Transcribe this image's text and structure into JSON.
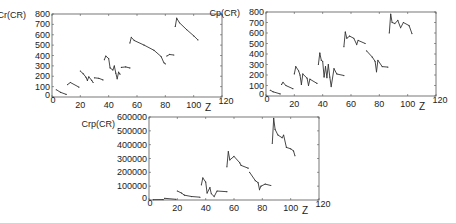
{
  "chart_data": [
    {
      "type": "line",
      "title": "",
      "ylabel": "Cr(CR)",
      "xlabel": "Z",
      "xlim": [
        0,
        120
      ],
      "ylim": [
        0,
        800
      ],
      "xticks": [
        0,
        20,
        40,
        60,
        80,
        100,
        120
      ],
      "yticks": [
        0,
        100,
        200,
        300,
        400,
        500,
        600,
        700,
        800
      ],
      "grid": false,
      "frame": {
        "left": 52,
        "right": 222,
        "top": 14,
        "bottom": 97
      },
      "segments": [
        [
          [
            3,
            70
          ],
          [
            6,
            45
          ],
          [
            10,
            25
          ]
        ],
        [
          [
            11,
            120
          ],
          [
            13,
            140
          ],
          [
            19,
            95
          ]
        ],
        [
          [
            20,
            250
          ],
          [
            22,
            225
          ],
          [
            24,
            190
          ],
          [
            25,
            160
          ],
          [
            26,
            195
          ],
          [
            28,
            160
          ],
          [
            29,
            140
          ]
        ],
        [
          [
            30,
            185
          ],
          [
            33,
            180
          ],
          [
            36,
            165
          ]
        ],
        [
          [
            37,
            360
          ],
          [
            38,
            395
          ],
          [
            40,
            370
          ],
          [
            41,
            280
          ],
          [
            43,
            260
          ],
          [
            44,
            300
          ],
          [
            45,
            230
          ],
          [
            46,
            175
          ],
          [
            47,
            240
          ],
          [
            48,
            220
          ]
        ],
        [
          [
            49,
            285
          ],
          [
            52,
            290
          ],
          [
            55,
            280
          ]
        ],
        [
          [
            55,
            520
          ],
          [
            56,
            575
          ],
          [
            58,
            545
          ],
          [
            65,
            500
          ],
          [
            72,
            450
          ],
          [
            77,
            390
          ],
          [
            79,
            330
          ],
          [
            80,
            320
          ]
        ],
        [
          [
            81,
            395
          ],
          [
            83,
            410
          ],
          [
            86,
            405
          ]
        ],
        [
          [
            87,
            680
          ],
          [
            88,
            760
          ],
          [
            90,
            715
          ],
          [
            95,
            650
          ],
          [
            100,
            590
          ],
          [
            103,
            550
          ]
        ]
      ]
    },
    {
      "type": "line",
      "title": "",
      "ylabel": "Cp(CR)",
      "xlabel": "Z",
      "xlim": [
        0,
        120
      ],
      "ylim": [
        0,
        800
      ],
      "xticks": [
        0,
        20,
        40,
        60,
        80,
        100,
        120
      ],
      "yticks": [
        0,
        100,
        200,
        300,
        400,
        500,
        600,
        700,
        800
      ],
      "grid": false,
      "frame": {
        "left": 266,
        "right": 436,
        "top": 12,
        "bottom": 96
      },
      "segments": [
        [
          [
            3,
            55
          ],
          [
            5,
            40
          ],
          [
            10,
            20
          ]
        ],
        [
          [
            11,
            110
          ],
          [
            12,
            130
          ],
          [
            14,
            100
          ],
          [
            19,
            70
          ]
        ],
        [
          [
            20,
            210
          ],
          [
            21,
            280
          ],
          [
            23,
            240
          ],
          [
            24,
            200
          ],
          [
            25,
            110
          ],
          [
            26,
            210
          ],
          [
            29,
            170
          ],
          [
            30,
            100
          ],
          [
            31,
            160
          ],
          [
            36,
            120
          ]
        ],
        [
          [
            37,
            300
          ],
          [
            38,
            410
          ],
          [
            39,
            340
          ],
          [
            40,
            330
          ],
          [
            41,
            180
          ],
          [
            42,
            280
          ],
          [
            43,
            175
          ],
          [
            44,
            300
          ],
          [
            45,
            180
          ],
          [
            46,
            90
          ],
          [
            48,
            260
          ],
          [
            50,
            210
          ],
          [
            55,
            195
          ]
        ],
        [
          [
            55,
            470
          ],
          [
            56,
            610
          ],
          [
            57,
            550
          ],
          [
            59,
            570
          ],
          [
            62,
            550
          ],
          [
            64,
            490
          ],
          [
            65,
            530
          ],
          [
            70,
            500
          ]
        ],
        [
          [
            71,
            430
          ],
          [
            75,
            370
          ],
          [
            77,
            330
          ],
          [
            78,
            230
          ],
          [
            79,
            340
          ],
          [
            82,
            280
          ],
          [
            86,
            275
          ]
        ],
        [
          [
            87,
            600
          ],
          [
            88,
            780
          ],
          [
            89,
            700
          ],
          [
            91,
            690
          ],
          [
            93,
            720
          ],
          [
            95,
            650
          ],
          [
            97,
            700
          ],
          [
            101,
            670
          ],
          [
            103,
            595
          ]
        ]
      ]
    },
    {
      "type": "line",
      "title": "",
      "ylabel": "Crp(CR)",
      "xlabel": "Z",
      "xlim": [
        0,
        120
      ],
      "ylim": [
        0,
        600000
      ],
      "xticks": [
        0,
        20,
        40,
        60,
        80,
        100,
        120
      ],
      "yticks": [
        0,
        100000,
        200000,
        300000,
        400000,
        500000,
        600000
      ],
      "grid": false,
      "frame": {
        "left": 149,
        "right": 319,
        "top": 117,
        "bottom": 200
      },
      "segments": [
        [
          [
            3,
            2000
          ],
          [
            10,
            3000
          ]
        ],
        [
          [
            11,
            12000
          ],
          [
            19,
            5000
          ]
        ],
        [
          [
            20,
            65000
          ],
          [
            23,
            50000
          ],
          [
            25,
            35000
          ],
          [
            30,
            25000
          ],
          [
            36,
            20000
          ]
        ],
        [
          [
            37,
            110000
          ],
          [
            38,
            160000
          ],
          [
            40,
            130000
          ],
          [
            41,
            50000
          ],
          [
            43,
            90000
          ],
          [
            44,
            45000
          ],
          [
            46,
            25000
          ],
          [
            48,
            65000
          ],
          [
            55,
            60000
          ]
        ],
        [
          [
            55,
            240000
          ],
          [
            56,
            350000
          ],
          [
            57,
            290000
          ],
          [
            60,
            315000
          ],
          [
            64,
            270000
          ],
          [
            65,
            250000
          ],
          [
            70,
            230000
          ]
        ],
        [
          [
            71,
            200000
          ],
          [
            75,
            140000
          ],
          [
            77,
            125000
          ],
          [
            78,
            75000
          ],
          [
            79,
            100000
          ],
          [
            82,
            115000
          ],
          [
            86,
            105000
          ]
        ],
        [
          [
            87,
            410000
          ],
          [
            88,
            590000
          ],
          [
            89,
            510000
          ],
          [
            91,
            470000
          ],
          [
            94,
            450000
          ],
          [
            95,
            470000
          ],
          [
            97,
            380000
          ],
          [
            100,
            370000
          ],
          [
            102,
            355000
          ],
          [
            103,
            320000
          ]
        ]
      ]
    }
  ],
  "colors": {
    "line": "#333333",
    "axis": "#555555",
    "text": "#222222"
  }
}
